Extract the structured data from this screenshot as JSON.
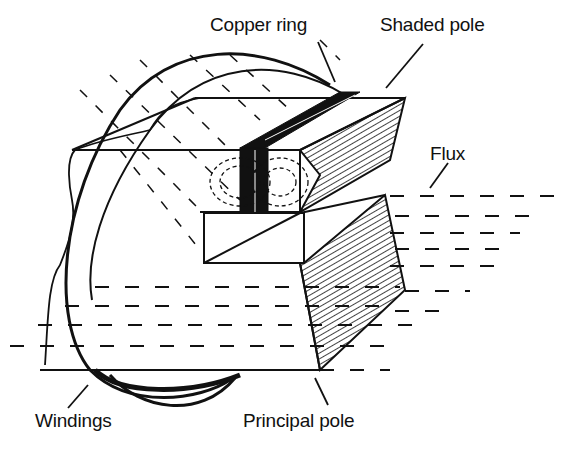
{
  "diagram": {
    "labels": {
      "copper_ring": "Copper ring",
      "shaded_pole": "Shaded pole",
      "flux": "Flux",
      "windings": "Windings",
      "principal_pole": "Principal pole"
    },
    "colors": {
      "ink": "#111111",
      "background": "#ffffff"
    }
  }
}
